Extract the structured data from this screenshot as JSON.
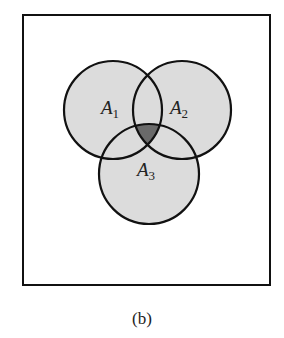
{
  "diagram": {
    "type": "venn",
    "universe": {
      "x": 23,
      "y": 15,
      "width": 247,
      "height": 270
    },
    "colors": {
      "fill": "#dcdcdc",
      "intersection_all": "#6a6a6a",
      "stroke": "#111111",
      "background": "#ffffff"
    },
    "sets": [
      {
        "id": "A1",
        "base": "A",
        "sub": "1",
        "cx": 113,
        "cy": 110,
        "r": 49,
        "label_x": 101,
        "label_y": 98
      },
      {
        "id": "A2",
        "base": "A",
        "sub": "2",
        "cx": 182,
        "cy": 110,
        "r": 49,
        "label_x": 170,
        "label_y": 98
      },
      {
        "id": "A3",
        "base": "A",
        "sub": "3",
        "cx": 149,
        "cy": 174,
        "r": 50,
        "label_x": 137,
        "label_y": 160
      }
    ],
    "highlighted_region": "A1 ∩ A2 ∩ A3"
  },
  "caption": "(b)"
}
